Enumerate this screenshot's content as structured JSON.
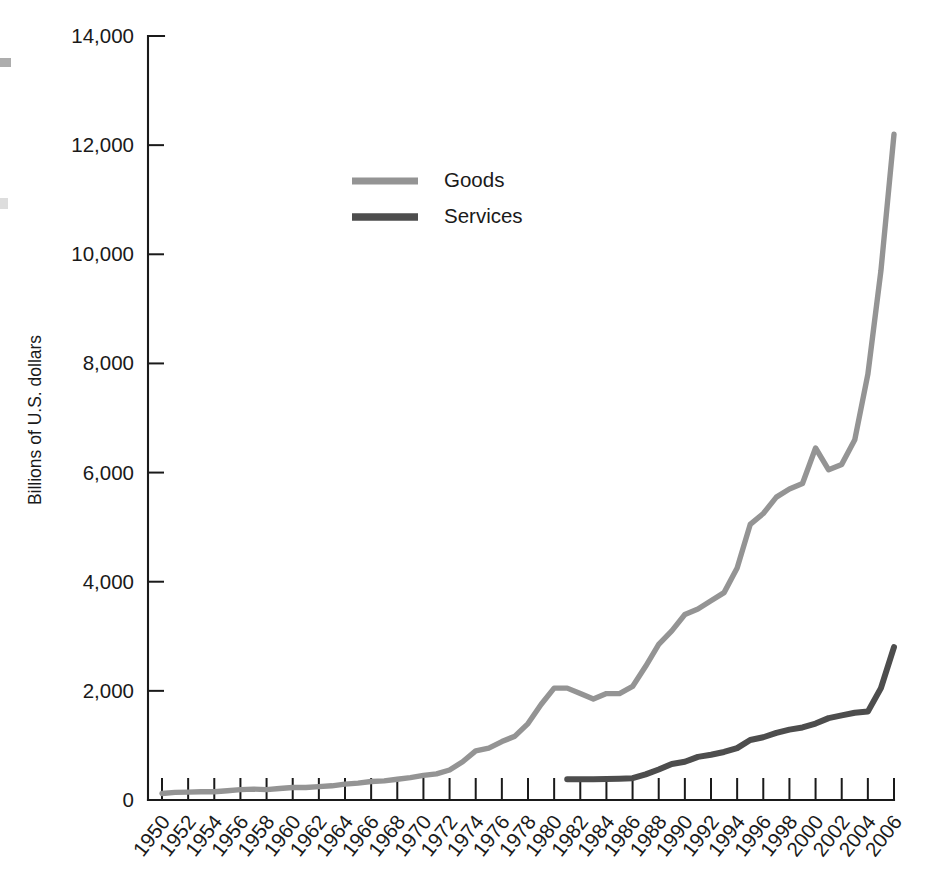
{
  "chart_data": {
    "type": "line",
    "title": "",
    "xlabel": "",
    "ylabel": "Billions of U.S. dollars",
    "xlim": [
      1950,
      2006
    ],
    "ylim": [
      0,
      14000
    ],
    "grid": false,
    "legend_position": "upper-left-inside",
    "ytick_labels": [
      "0",
      "2,000",
      "4,000",
      "6,000",
      "8,000",
      "10,000",
      "12,000",
      "14,000"
    ],
    "ytick_values": [
      0,
      2000,
      4000,
      6000,
      8000,
      10000,
      12000,
      14000
    ],
    "xtick_labels": [
      "1950",
      "1952",
      "1954",
      "1956",
      "1958",
      "1960",
      "1962",
      "1964",
      "1966",
      "1968",
      "1970",
      "1972",
      "1974",
      "1976",
      "1978",
      "1980",
      "1982",
      "1984",
      "1986",
      "1988",
      "1990",
      "1992",
      "1994",
      "1996",
      "1998",
      "2000",
      "2002",
      "2004",
      "2006"
    ],
    "xtick_values": [
      1950,
      1952,
      1954,
      1956,
      1958,
      1960,
      1962,
      1964,
      1966,
      1968,
      1970,
      1972,
      1974,
      1976,
      1978,
      1980,
      1982,
      1984,
      1986,
      1988,
      1990,
      1992,
      1994,
      1996,
      1998,
      2000,
      2002,
      2004,
      2006
    ],
    "series": [
      {
        "name": "Goods",
        "color": "#949494",
        "linewidth": 5.4,
        "x": [
          1950,
          1951,
          1952,
          1953,
          1954,
          1955,
          1956,
          1957,
          1958,
          1959,
          1960,
          1961,
          1962,
          1963,
          1964,
          1965,
          1966,
          1967,
          1968,
          1969,
          1970,
          1971,
          1972,
          1973,
          1974,
          1975,
          1976,
          1977,
          1978,
          1979,
          1980,
          1981,
          1982,
          1983,
          1984,
          1985,
          1986,
          1987,
          1988,
          1989,
          1990,
          1991,
          1992,
          1993,
          1994,
          1995,
          1996,
          1997,
          1998,
          1999,
          2000,
          2001,
          2002,
          2003,
          2004,
          2005,
          2006
        ],
        "y": [
          120,
          140,
          145,
          150,
          150,
          170,
          190,
          200,
          190,
          210,
          230,
          230,
          245,
          260,
          290,
          310,
          340,
          350,
          380,
          410,
          450,
          480,
          550,
          700,
          900,
          950,
          1070,
          1170,
          1400,
          1750,
          2050,
          2050,
          1950,
          1850,
          1950,
          1950,
          2080,
          2450,
          2850,
          3100,
          3400,
          3500,
          3650,
          3800,
          4250,
          5050,
          5250,
          5550,
          5700,
          5800,
          6450,
          6050,
          6150,
          6600,
          7800,
          9700,
          12200
        ]
      },
      {
        "name": "Services",
        "color": "#4d4d4d",
        "linewidth": 6.0,
        "x": [
          1981,
          1982,
          1983,
          1984,
          1985,
          1986,
          1987,
          1988,
          1989,
          1990,
          1991,
          1992,
          1993,
          1994,
          1995,
          1996,
          1997,
          1998,
          1999,
          2000,
          2001,
          2002,
          2003,
          2004,
          2005,
          2006
        ],
        "y": [
          380,
          380,
          380,
          385,
          390,
          400,
          470,
          560,
          660,
          700,
          790,
          830,
          880,
          950,
          1100,
          1150,
          1230,
          1290,
          1330,
          1400,
          1500,
          1550,
          1600,
          1620,
          2050,
          2800
        ]
      }
    ],
    "legend": [
      {
        "label": "Goods",
        "color": "#949494"
      },
      {
        "label": "Services",
        "color": "#4d4d4d"
      }
    ]
  },
  "plot_geometry": {
    "left": 148,
    "right": 894,
    "top": 36,
    "bottom": 800
  }
}
